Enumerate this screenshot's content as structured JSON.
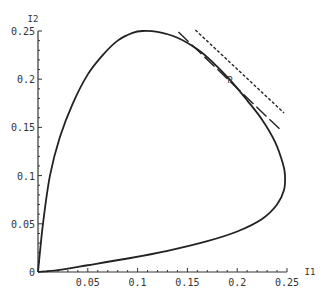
{
  "chart_data": {
    "type": "line",
    "title": "",
    "xlabel": "I1",
    "ylabel": "I2",
    "xlim": [
      0,
      0.25
    ],
    "ylim": [
      0,
      0.25
    ],
    "grid": false,
    "xticks": [
      "0.05",
      "0.1",
      "0.15",
      "0.2",
      "0.25"
    ],
    "yticks": [
      "0",
      "0.05",
      "0.1",
      "0.15",
      "0.2",
      "0.25"
    ],
    "series": [
      {
        "name": "boundary curve",
        "style": "solid",
        "points": [
          [
            0,
            0
          ],
          [
            0.005,
            0.05
          ],
          [
            0.012,
            0.1
          ],
          [
            0.022,
            0.14
          ],
          [
            0.035,
            0.175
          ],
          [
            0.05,
            0.205
          ],
          [
            0.065,
            0.225
          ],
          [
            0.08,
            0.24
          ],
          [
            0.095,
            0.248
          ],
          [
            0.105,
            0.25
          ],
          [
            0.12,
            0.249
          ],
          [
            0.14,
            0.243
          ],
          [
            0.16,
            0.231
          ],
          [
            0.175,
            0.218
          ],
          [
            0.193,
            0.199
          ],
          [
            0.21,
            0.178
          ],
          [
            0.225,
            0.158
          ],
          [
            0.238,
            0.135
          ],
          [
            0.246,
            0.112
          ],
          [
            0.248,
            0.1
          ],
          [
            0.247,
            0.085
          ],
          [
            0.24,
            0.07
          ],
          [
            0.225,
            0.055
          ],
          [
            0.2,
            0.042
          ],
          [
            0.17,
            0.032
          ],
          [
            0.13,
            0.022
          ],
          [
            0.09,
            0.014
          ],
          [
            0.05,
            0.007
          ],
          [
            0.02,
            0.002
          ],
          [
            0,
            0
          ]
        ]
      },
      {
        "name": "tangent (long dash)",
        "style": "long-dash",
        "points": [
          [
            0.141,
            0.249
          ],
          [
            0.245,
            0.146
          ]
        ]
      },
      {
        "name": "tangent (short dash)",
        "style": "short-dash",
        "points": [
          [
            0.158,
            0.251
          ],
          [
            0.247,
            0.165
          ]
        ]
      }
    ],
    "annotations": [
      {
        "text": "P",
        "x": 0.193,
        "y": 0.199
      }
    ]
  }
}
